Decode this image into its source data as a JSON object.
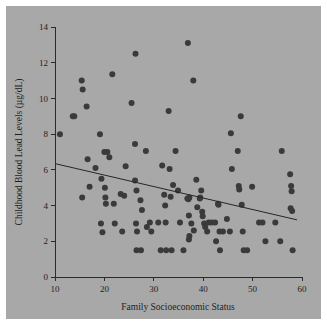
{
  "figure": {
    "background_color": "#a8a8a8",
    "page_color": "#ffffff",
    "point_color": "#3a3a3a",
    "axis_color": "#2b2b2b",
    "fit_line_color": "#262626"
  },
  "chart_data": {
    "type": "scatter",
    "title": "",
    "xlabel": "Family Socioeconomic Status",
    "ylabel": "Childhood Blood Lead Levels (µg/dL)",
    "xlim": [
      10,
      60
    ],
    "ylim": [
      0,
      14
    ],
    "xticks": [
      10,
      20,
      30,
      40,
      50,
      60
    ],
    "yticks": [
      0,
      2,
      4,
      6,
      8,
      10,
      12,
      14
    ],
    "xtick_labels": [
      "10",
      "20",
      "30",
      "40",
      "50",
      "60"
    ],
    "ytick_labels": [
      "0",
      "2",
      "4",
      "6",
      "8",
      "10",
      "12",
      "14"
    ],
    "grid": false,
    "legend": null,
    "legend_position": "none",
    "marker": "circle",
    "marker_size": 3.0,
    "series": [
      {
        "name": "Children",
        "points": [
          [
            11.0,
            8.0
          ],
          [
            13.6,
            9.0
          ],
          [
            13.9,
            9.0
          ],
          [
            15.4,
            11.0
          ],
          [
            15.6,
            10.5
          ],
          [
            15.5,
            4.45
          ],
          [
            16.4,
            9.55
          ],
          [
            16.6,
            6.6
          ],
          [
            17.0,
            5.05
          ],
          [
            18.2,
            6.1
          ],
          [
            19.1,
            8.0
          ],
          [
            19.3,
            3.0
          ],
          [
            19.4,
            5.5
          ],
          [
            19.6,
            2.5
          ],
          [
            20.0,
            7.0
          ],
          [
            20.6,
            7.0
          ],
          [
            20.1,
            5.0
          ],
          [
            20.2,
            4.45
          ],
          [
            20.3,
            4.1
          ],
          [
            21.0,
            6.7
          ],
          [
            21.6,
            11.35
          ],
          [
            21.9,
            4.1
          ],
          [
            22.1,
            3.0
          ],
          [
            23.3,
            4.65
          ],
          [
            23.6,
            2.55
          ],
          [
            24.0,
            4.55
          ],
          [
            24.3,
            6.2
          ],
          [
            25.5,
            9.75
          ],
          [
            26.2,
            7.45
          ],
          [
            26.3,
            12.5
          ],
          [
            26.2,
            5.4
          ],
          [
            26.5,
            4.85
          ],
          [
            26.4,
            3.0
          ],
          [
            26.6,
            2.55
          ],
          [
            26.5,
            1.5
          ],
          [
            27.4,
            1.5
          ],
          [
            27.3,
            4.3
          ],
          [
            27.6,
            3.75
          ],
          [
            28.4,
            7.05
          ],
          [
            28.6,
            2.8
          ],
          [
            29.2,
            3.05
          ],
          [
            29.5,
            2.55
          ],
          [
            30.9,
            3.05
          ],
          [
            31.4,
            1.5
          ],
          [
            31.7,
            6.25
          ],
          [
            32.1,
            4.6
          ],
          [
            32.3,
            4.0
          ],
          [
            32.4,
            3.05
          ],
          [
            32.5,
            1.5
          ],
          [
            33.0,
            9.3
          ],
          [
            33.2,
            6.05
          ],
          [
            33.4,
            4.5
          ],
          [
            33.6,
            1.5
          ],
          [
            33.9,
            5.15
          ],
          [
            34.4,
            7.05
          ],
          [
            34.9,
            4.85
          ],
          [
            35.3,
            3.05
          ],
          [
            36.0,
            1.5
          ],
          [
            36.9,
            13.1
          ],
          [
            36.8,
            4.4
          ],
          [
            37.2,
            4.45
          ],
          [
            37.0,
            4.35
          ],
          [
            37.1,
            3.45
          ],
          [
            37.2,
            2.3
          ],
          [
            37.1,
            2.1
          ],
          [
            37.6,
            3.0
          ],
          [
            38.1,
            2.6
          ],
          [
            38.0,
            11.0
          ],
          [
            38.6,
            5.45
          ],
          [
            38.8,
            3.9
          ],
          [
            39.3,
            4.4
          ],
          [
            39.4,
            4.45
          ],
          [
            39.6,
            4.85
          ],
          [
            39.8,
            3.65
          ],
          [
            39.9,
            3.4
          ],
          [
            40.2,
            3.0
          ],
          [
            40.4,
            2.8
          ],
          [
            40.8,
            2.55
          ],
          [
            41.1,
            3.05
          ],
          [
            41.7,
            3.05
          ],
          [
            42.4,
            3.05
          ],
          [
            42.6,
            2.0
          ],
          [
            43.0,
            4.1
          ],
          [
            43.1,
            4.05
          ],
          [
            43.3,
            2.55
          ],
          [
            43.4,
            1.5
          ],
          [
            44.0,
            2.55
          ],
          [
            44.8,
            3.25
          ],
          [
            45.4,
            2.55
          ],
          [
            45.6,
            8.05
          ],
          [
            45.8,
            6.05
          ],
          [
            47.0,
            7.05
          ],
          [
            47.2,
            5.1
          ],
          [
            47.3,
            4.9
          ],
          [
            47.6,
            9.0
          ],
          [
            47.8,
            4.05
          ],
          [
            48.0,
            2.55
          ],
          [
            48.2,
            1.5
          ],
          [
            48.9,
            1.5
          ],
          [
            49.9,
            5.05
          ],
          [
            51.3,
            3.05
          ],
          [
            52.0,
            3.05
          ],
          [
            52.6,
            2.0
          ],
          [
            54.6,
            3.05
          ],
          [
            55.9,
            7.05
          ],
          [
            55.6,
            2.0
          ],
          [
            57.6,
            5.75
          ],
          [
            57.8,
            5.1
          ],
          [
            57.9,
            4.8
          ],
          [
            57.7,
            3.85
          ],
          [
            58.0,
            3.7
          ],
          [
            58.1,
            1.5
          ]
        ]
      }
    ],
    "fit_line": {
      "name": "linear-regression-line",
      "x_start": 10.0,
      "y_start": 6.35,
      "x_end": 59.0,
      "y_end": 3.2,
      "slope": -0.0643,
      "intercept": 6.993
    }
  }
}
